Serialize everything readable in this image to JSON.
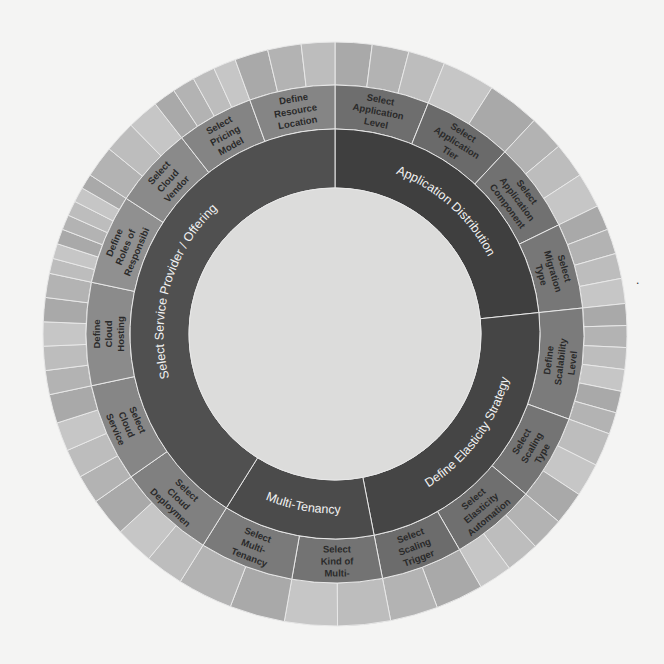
{
  "diagram": {
    "type": "sunburst",
    "center": [
      335,
      334
    ],
    "radii": {
      "hole": 146,
      "inner": 205,
      "middle": 249,
      "outer": 292
    },
    "colors": {
      "background": "#f4f4f3",
      "hole": "#dcdcdb",
      "inner_a": "#4a4a4a",
      "inner_b": "#555555",
      "middle": [
        "#7a7a7a",
        "#6f6f6f",
        "#858585",
        "#8f8f8f",
        "#999999"
      ],
      "outer": [
        "#a9a9a9",
        "#b3b3b3",
        "#bdbdbd",
        "#c6c6c6"
      ],
      "separator": "#e8e8e8"
    },
    "inner_ring": [
      {
        "label": "Application Distribution",
        "start": 0,
        "end": 84,
        "color": "#3f3f3f"
      },
      {
        "label": "Define Elasticity Strategy",
        "start": 84,
        "end": 169,
        "color": "#454545"
      },
      {
        "label": "Multi-Tenancy",
        "start": 169,
        "end": 212,
        "color": "#4b4b4b"
      },
      {
        "label": "Select Service Provider / Offering",
        "start": 212,
        "end": 360,
        "color": "#505050"
      }
    ],
    "middle_ring": [
      {
        "lines": [
          "Select",
          "Application",
          "Level"
        ],
        "start": 0,
        "end": 22,
        "color": "#6e6e6e",
        "outer_splits": 3
      },
      {
        "lines": [
          "Select",
          "Application",
          "Tier"
        ],
        "start": 22,
        "end": 43,
        "color": "#6a6a6a",
        "outer_splits": 2
      },
      {
        "lines": [
          "Select",
          "Application",
          "Component"
        ],
        "start": 43,
        "end": 64,
        "color": "#717171",
        "outer_splits": 3
      },
      {
        "lines": [
          "Select",
          "Migration",
          "Type"
        ],
        "start": 64,
        "end": 84,
        "color": "#777777",
        "outer_splits": 4
      },
      {
        "lines": [
          "Define",
          "Scalability",
          "Level"
        ],
        "start": 84,
        "end": 110,
        "color": "#7b7b7b",
        "outer_splits": 6
      },
      {
        "lines": [
          "Select",
          "Scaling",
          "Type"
        ],
        "start": 110,
        "end": 130,
        "color": "#747474",
        "outer_splits": 3
      },
      {
        "lines": [
          "Select",
          "Elasticity",
          "Automation"
        ],
        "start": 130,
        "end": 150,
        "color": "#6f6f6f",
        "outer_splits": 3
      },
      {
        "lines": [
          "Select",
          "Scaling",
          "Trigger"
        ],
        "start": 150,
        "end": 169,
        "color": "#6c6c6c",
        "outer_splits": 2
      },
      {
        "lines": [
          "Select",
          "Kind of",
          "Multi-"
        ],
        "start": 169,
        "end": 190,
        "color": "#737373",
        "outer_splits": 2
      },
      {
        "lines": [
          "Select",
          "Multi-",
          "Tenancy"
        ],
        "start": 190,
        "end": 212,
        "color": "#7a7a7a",
        "outer_splits": 2
      },
      {
        "lines": [
          "Select",
          "Cloud",
          "Deploymen"
        ],
        "start": 212,
        "end": 235,
        "color": "#808080",
        "outer_splits": 3
      },
      {
        "lines": [
          "Select",
          "Cloud",
          "Service"
        ],
        "start": 235,
        "end": 258,
        "color": "#868686",
        "outer_splits": 4
      },
      {
        "lines": [
          "Define",
          "Cloud",
          "Hosting"
        ],
        "start": 258,
        "end": 282,
        "color": "#8b8b8b",
        "outer_splits": 5
      },
      {
        "lines": [
          "Define",
          "Roles of",
          "Responsibi"
        ],
        "start": 282,
        "end": 303,
        "color": "#909090",
        "outer_splits": 7
      },
      {
        "lines": [
          "Select",
          "Cloud",
          "Vendor"
        ],
        "start": 303,
        "end": 322,
        "color": "#8a8a8a",
        "outer_splits": 3
      },
      {
        "lines": [
          "Select",
          "Pricing",
          "Model"
        ],
        "start": 322,
        "end": 340,
        "color": "#848484",
        "outer_splits": 4
      },
      {
        "lines": [
          "Define",
          "Resource",
          "Location"
        ],
        "start": 340,
        "end": 360,
        "color": "#858585",
        "outer_splits": 3
      }
    ],
    "page_marker": "."
  }
}
